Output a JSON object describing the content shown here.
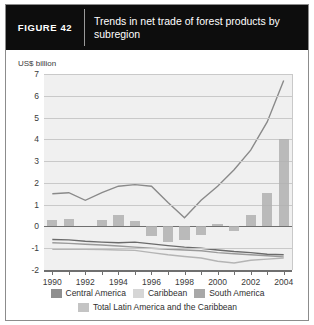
{
  "figure": {
    "tag": "FIGURE  42",
    "title": "Trends in net trade of forest products by subregion"
  },
  "colors": {
    "header_bg": "#0d0d0d",
    "panel_bg": "#f0f0f0",
    "grid": "#c9c9c9",
    "axis": "#6f6f6f",
    "central_america": "#8f8f8f",
    "caribbean": "#d6d6d6",
    "south_america": "#a8a8a8",
    "total": "#c4c4c4",
    "line_south_america": "#8a8a8a",
    "line_total": "#6b6b6b",
    "line_central_america": "#9a9a9a",
    "line_caribbean": "#b4b4b4"
  },
  "chart_data": {
    "type": "bar",
    "title": "Trends in net trade of forest products by subregion",
    "xlabel": "",
    "ylabel": "US$ billion",
    "ylim": [
      -2,
      7
    ],
    "yticks": [
      -2,
      -1,
      0,
      1,
      2,
      3,
      4,
      5,
      6,
      7
    ],
    "ytick_labels": [
      "-2",
      "-1",
      "0",
      "1",
      "2",
      "3",
      "4",
      "5",
      "6",
      "7"
    ],
    "grid": true,
    "legend_position": "bottom",
    "x": [
      1990,
      1991,
      1992,
      1993,
      1994,
      1995,
      1996,
      1997,
      1998,
      1999,
      2000,
      2001,
      2002,
      2003,
      2004
    ],
    "xtick_labels": [
      "1990",
      "",
      "1992",
      "",
      "1994",
      "",
      "1996",
      "",
      "1998",
      "",
      "2000",
      "",
      "2002",
      "",
      "2004"
    ],
    "series": [
      {
        "name": "Central America",
        "render": "line",
        "color": "#9a9a9a",
        "values": [
          -0.75,
          -0.78,
          -0.82,
          -0.85,
          -0.9,
          -0.95,
          -1.0,
          -1.05,
          -1.08,
          -1.12,
          -1.2,
          -1.25,
          -1.3,
          -1.35,
          -1.4
        ]
      },
      {
        "name": "Caribbean",
        "render": "line",
        "color": "#b4b4b4",
        "values": [
          -1.05,
          -1.05,
          -1.05,
          -1.06,
          -1.08,
          -1.1,
          -1.2,
          -1.3,
          -1.38,
          -1.45,
          -1.6,
          -1.68,
          -1.55,
          -1.5,
          -1.45
        ]
      },
      {
        "name": "South America",
        "render": "line",
        "color": "#8a8a8a",
        "values": [
          1.5,
          1.55,
          1.2,
          1.55,
          1.85,
          1.92,
          1.85,
          1.1,
          0.4,
          1.2,
          1.85,
          2.6,
          3.5,
          4.8,
          6.7
        ]
      },
      {
        "name": "Total Latin America and the Caribbean",
        "render": "line",
        "color": "#6b6b6b",
        "values": [
          -0.6,
          -0.62,
          -0.68,
          -0.72,
          -0.75,
          -0.72,
          -0.8,
          -0.88,
          -0.95,
          -1.0,
          -1.08,
          -1.15,
          -1.2,
          -1.28,
          -1.3
        ]
      },
      {
        "name": "Bars",
        "render": "bar",
        "color": "#b0b0b0",
        "values": [
          0.28,
          0.35,
          0.0,
          0.3,
          0.52,
          0.25,
          -0.45,
          -0.72,
          -0.62,
          -0.38,
          0.12,
          -0.22,
          0.52,
          1.55,
          4.0
        ]
      }
    ]
  },
  "legend": [
    {
      "label": "Central America",
      "color": "#8f8f8f"
    },
    {
      "label": "Caribbean",
      "color": "#d6d6d6"
    },
    {
      "label": "South America",
      "color": "#a8a8a8"
    },
    {
      "label": "Total Latin America and the Caribbean",
      "color": "#c4c4c4"
    }
  ]
}
